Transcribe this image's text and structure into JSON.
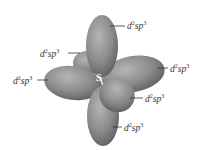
{
  "diagram": {
    "type": "hybrid-orbital-illustration",
    "central_atom": "S",
    "orbital_label": {
      "base_d": "d",
      "sup1": "2",
      "mid": "sp",
      "sup2": "3"
    },
    "lobes": [
      {
        "id": "top",
        "label": "d2sp3"
      },
      {
        "id": "back-left",
        "label": "d2sp3"
      },
      {
        "id": "left",
        "label": "d2sp3"
      },
      {
        "id": "right",
        "label": "d2sp3"
      },
      {
        "id": "front-right",
        "label": "d2sp3"
      },
      {
        "id": "bottom",
        "label": "d2sp3"
      }
    ],
    "colors": {
      "lobe_fill": "#8a8a8a",
      "lobe_highlight": "#b8b8b8",
      "lobe_shadow": "#5e5e5e",
      "label": "#333333",
      "leader_line": "#333333"
    }
  }
}
